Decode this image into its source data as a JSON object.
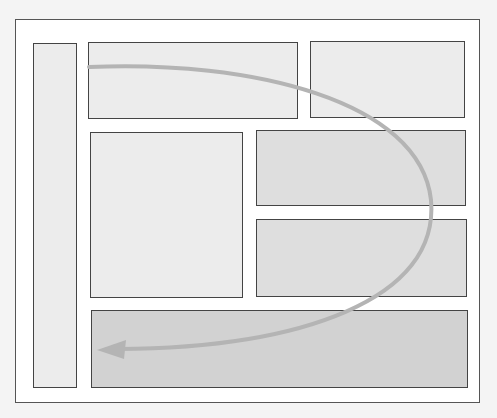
{
  "diagram": {
    "type": "page-layout-wireframe",
    "colors": {
      "background": "#f4f4f4",
      "frame": "#ffffff",
      "border": "#444444",
      "light_fill": "#ececec",
      "mid_fill": "#dedede",
      "dark_fill": "#d2d2d2",
      "path_stroke": "#b4b4b4"
    },
    "blocks": [
      {
        "id": "sidebar",
        "shade": "light"
      },
      {
        "id": "header-left",
        "shade": "light"
      },
      {
        "id": "header-right",
        "shade": "light"
      },
      {
        "id": "content-left",
        "shade": "light"
      },
      {
        "id": "content-right-top",
        "shade": "mid"
      },
      {
        "id": "content-right-bottom",
        "shade": "mid"
      },
      {
        "id": "footer",
        "shade": "dark"
      }
    ],
    "reading_path": {
      "start": "header-left",
      "end": "footer",
      "shape": "curved-arrow"
    }
  }
}
